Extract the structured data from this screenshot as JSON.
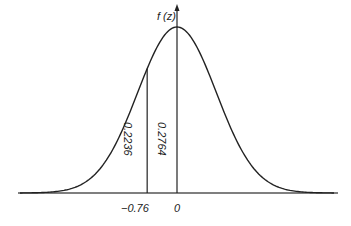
{
  "chart_data": {
    "type": "line",
    "title": "",
    "xlabel": "",
    "ylabel": "f (z)",
    "x_ticks": [
      "-0.76",
      "0"
    ],
    "annotations": [
      {
        "text": "0.2236",
        "region": "between z=-0.76 and z=0",
        "orientation": "vertical"
      },
      {
        "text": "0.2764",
        "region": "just right of z=-0.76 line / left of axis",
        "orientation": "vertical"
      }
    ],
    "vertical_lines": [
      {
        "x": -0.76,
        "label": "-0.76"
      },
      {
        "x": 0,
        "label": "0"
      }
    ],
    "xlim": [
      -4,
      4
    ],
    "grid": false,
    "legend": null
  },
  "labels": {
    "y_axis": "f (z)",
    "tick_neg": "−0.76",
    "tick_zero": "0",
    "area_left": "0.2236",
    "area_right": "0.2764"
  }
}
